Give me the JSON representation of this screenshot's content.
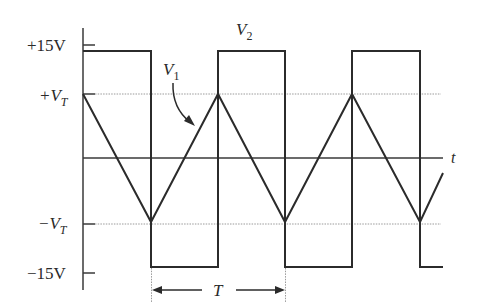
{
  "diagram": {
    "type": "waveform-timing-diagram",
    "y_axis_labels": {
      "plus_15v": "+15V",
      "plus_vt_main": "+V",
      "plus_vt_sub": "T",
      "minus_vt_main": "−V",
      "minus_vt_sub": "T",
      "minus_15v": "−15V"
    },
    "time_axis_label": "t",
    "signals": [
      {
        "name": "V2",
        "main": "V",
        "sub": "2",
        "shape": "square",
        "high": "+15V",
        "low": "-15V"
      },
      {
        "name": "V1",
        "main": "V",
        "sub": "1",
        "shape": "triangle",
        "high": "+VT",
        "low": "-VT"
      }
    ],
    "period_label": "T",
    "colors": {
      "waveform": "#2b2b2b",
      "guide_lines": "#9a9a9a",
      "background": "#ffffff"
    }
  }
}
